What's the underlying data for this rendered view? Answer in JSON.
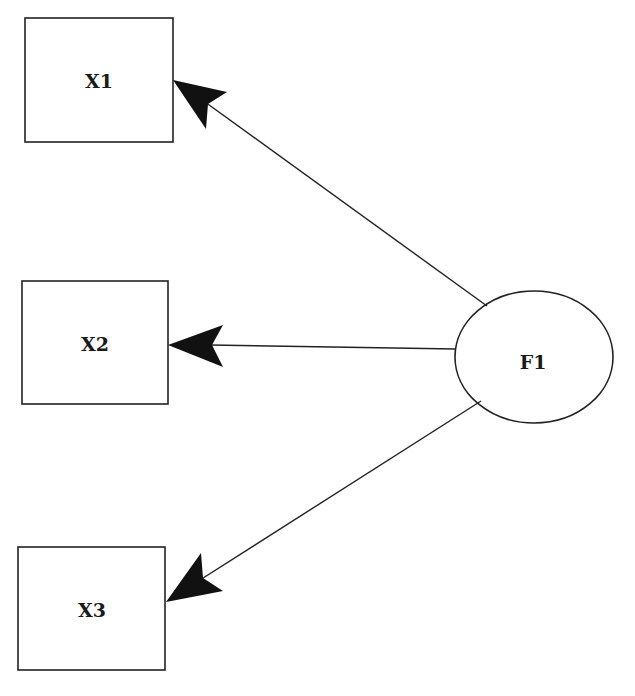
{
  "diagram": {
    "type": "path-diagram",
    "colors": {
      "stroke": "#222222",
      "arrowhead": "#111111",
      "background": "#ffffff"
    },
    "nodes": [
      {
        "id": "X1",
        "label": "X1",
        "shape": "rectangle"
      },
      {
        "id": "X2",
        "label": "X2",
        "shape": "rectangle"
      },
      {
        "id": "X3",
        "label": "X3",
        "shape": "rectangle"
      },
      {
        "id": "F1",
        "label": "F1",
        "shape": "ellipse"
      }
    ],
    "edges": [
      {
        "from": "F1",
        "to": "X1",
        "directed": true
      },
      {
        "from": "F1",
        "to": "X2",
        "directed": true
      },
      {
        "from": "F1",
        "to": "X3",
        "directed": true
      }
    ]
  }
}
